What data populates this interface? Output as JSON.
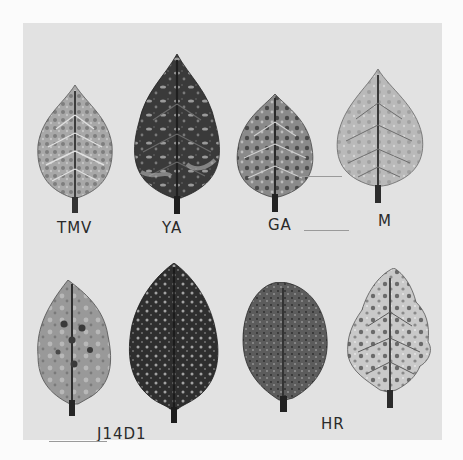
{
  "figure": {
    "rows": [
      {
        "leaves": [
          {
            "id": "leaf-1",
            "label": "TMV",
            "tone": "mottled-light"
          },
          {
            "id": "leaf-2",
            "label": "YA",
            "tone": "dark-mottled"
          },
          {
            "id": "leaf-3",
            "label": "GA",
            "tone": "medium-mottled"
          },
          {
            "id": "leaf-4",
            "label": "M",
            "tone": "light"
          }
        ]
      },
      {
        "leaves": [
          {
            "id": "leaf-5",
            "label": "",
            "tone": "light-lesions"
          },
          {
            "id": "leaf-6",
            "label": "",
            "tone": "dark-speckled"
          },
          {
            "id": "leaf-7",
            "label": "",
            "tone": "dark-spotted"
          },
          {
            "id": "leaf-8",
            "label": "",
            "tone": "light-mosaic"
          }
        ],
        "group_labels": [
          {
            "text": "J14D1"
          },
          {
            "text": "HR"
          }
        ]
      }
    ]
  },
  "colors": {
    "page_background": "#fbfbfb",
    "panel_background": "#e2e2e2",
    "label_text": "#2a2a2a"
  }
}
